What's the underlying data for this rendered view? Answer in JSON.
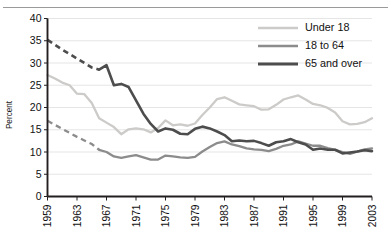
{
  "figure": {
    "has_top_rule": true,
    "background": "#ffffff"
  },
  "chart_data": {
    "type": "line",
    "title": "",
    "subtitle": "",
    "xlabel": "",
    "ylabel": "Percent",
    "xlim": [
      1959,
      2003
    ],
    "ylim": [
      0,
      40
    ],
    "ytick_step": 5,
    "yticks": [
      0,
      5,
      10,
      15,
      20,
      25,
      30,
      35,
      40
    ],
    "xticks": [
      1959,
      1963,
      1967,
      1971,
      1975,
      1979,
      1983,
      1987,
      1991,
      1995,
      1999,
      2003
    ],
    "xtick_labels": [
      "1959",
      "1963",
      "1967",
      "1971",
      "1975",
      "1979",
      "1983",
      "1987",
      "1991",
      "1995",
      "1999",
      "2003"
    ],
    "ytick_labels": [
      "0",
      "5",
      "10",
      "15",
      "20",
      "25",
      "30",
      "35",
      "40"
    ],
    "grid": "horizontal",
    "grid_color": "#e2e2e2",
    "axis_color": "#231f20",
    "legend_position": "top-right",
    "x": [
      1959,
      1960,
      1961,
      1962,
      1963,
      1964,
      1965,
      1966,
      1967,
      1968,
      1969,
      1970,
      1971,
      1972,
      1973,
      1974,
      1975,
      1976,
      1977,
      1978,
      1979,
      1980,
      1981,
      1982,
      1983,
      1984,
      1985,
      1986,
      1987,
      1988,
      1989,
      1990,
      1991,
      1992,
      1993,
      1994,
      1995,
      1996,
      1997,
      1998,
      1999,
      2000,
      2001,
      2002,
      2003
    ],
    "series": [
      {
        "name": "Under 18",
        "color": "#cccbc9",
        "width": 2.3,
        "dashed_start_year": null,
        "values": [
          27.3,
          26.5,
          25.6,
          25.0,
          23.1,
          23.0,
          21.0,
          17.6,
          16.6,
          15.6,
          14.0,
          15.1,
          15.3,
          15.1,
          14.4,
          15.4,
          17.1,
          16.0,
          16.2,
          15.9,
          16.4,
          18.3,
          20.0,
          21.9,
          22.3,
          21.5,
          20.7,
          20.5,
          20.3,
          19.5,
          19.6,
          20.6,
          21.8,
          22.3,
          22.7,
          21.8,
          20.8,
          20.5,
          19.9,
          18.9,
          16.9,
          16.2,
          16.3,
          16.7,
          17.6
        ]
      },
      {
        "name": "18 to 64",
        "color": "#8c8c8c",
        "width": 2.3,
        "dashed_start_year": 1959,
        "dashed_end_year": 1966,
        "values": [
          17.0,
          16.1,
          15.2,
          14.3,
          13.4,
          12.6,
          11.8,
          10.5,
          10.0,
          9.0,
          8.7,
          9.0,
          9.3,
          8.8,
          8.3,
          8.3,
          9.2,
          9.0,
          8.8,
          8.7,
          8.9,
          10.1,
          11.1,
          12.0,
          12.4,
          11.7,
          11.3,
          10.8,
          10.6,
          10.5,
          10.2,
          10.7,
          11.4,
          11.7,
          12.4,
          11.9,
          11.4,
          11.4,
          10.9,
          10.5,
          10.0,
          9.6,
          10.1,
          10.6,
          10.8
        ]
      },
      {
        "name": "65 and over",
        "color": "#4d4d4d",
        "width": 2.6,
        "dashed_start_year": 1959,
        "dashed_end_year": 1966,
        "values": [
          35.2,
          34.1,
          33.0,
          32.0,
          31.0,
          30.0,
          29.0,
          28.5,
          29.5,
          25.0,
          25.3,
          24.6,
          21.6,
          18.6,
          16.3,
          14.6,
          15.3,
          15.0,
          14.1,
          14.0,
          15.2,
          15.7,
          15.3,
          14.6,
          13.8,
          12.4,
          12.6,
          12.4,
          12.5,
          12.0,
          11.4,
          12.2,
          12.4,
          12.9,
          12.2,
          11.7,
          10.5,
          10.8,
          10.5,
          10.5,
          9.7,
          9.9,
          10.1,
          10.4,
          10.2
        ]
      }
    ],
    "legend": [
      {
        "label": "Under 18",
        "color": "#cccbc9"
      },
      {
        "label": "18 to 64",
        "color": "#8c8c8c"
      },
      {
        "label": "65 and over",
        "color": "#4d4d4d"
      }
    ]
  }
}
